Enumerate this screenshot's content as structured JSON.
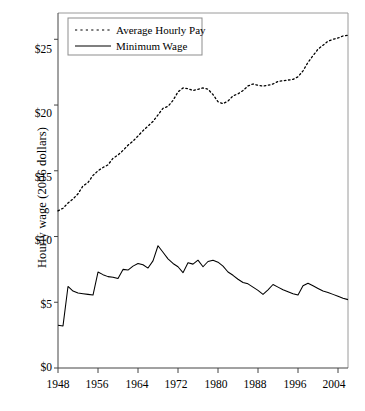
{
  "chart_data": {
    "type": "line",
    "title": "",
    "subtitle": "",
    "xlabel": "",
    "ylabel": "Hourly wage (2006 dollars)",
    "xlim": [
      1948,
      2006
    ],
    "ylim": [
      0,
      27
    ],
    "grid": false,
    "legend_position": "top-left",
    "x_ticks": [
      "1948",
      "1956",
      "1964",
      "1972",
      "1980",
      "1988",
      "1996",
      "2004"
    ],
    "x_tick_values": [
      1948,
      1956,
      1964,
      1972,
      1980,
      1988,
      1996,
      2004
    ],
    "y_ticks": [
      "$0",
      "$5",
      "$10",
      "$15",
      "$20",
      "$25"
    ],
    "y_tick_values": [
      0,
      5,
      10,
      15,
      20,
      25
    ],
    "x": [
      1948,
      1949,
      1950,
      1951,
      1952,
      1953,
      1954,
      1955,
      1956,
      1957,
      1958,
      1959,
      1960,
      1961,
      1962,
      1963,
      1964,
      1965,
      1966,
      1967,
      1968,
      1969,
      1970,
      1971,
      1972,
      1973,
      1974,
      1975,
      1976,
      1977,
      1978,
      1979,
      1980,
      1981,
      1982,
      1983,
      1984,
      1985,
      1986,
      1987,
      1988,
      1989,
      1990,
      1991,
      1992,
      1993,
      1994,
      1995,
      1996,
      1997,
      1998,
      1999,
      2000,
      2001,
      2002,
      2003,
      2004,
      2005,
      2006
    ],
    "series": [
      {
        "name": "Average Hourly Pay",
        "style": "dotted",
        "color": "#000000",
        "values": [
          11.95,
          12.15,
          12.55,
          12.85,
          13.25,
          13.85,
          14.1,
          14.65,
          15.0,
          15.25,
          15.45,
          15.95,
          16.2,
          16.55,
          16.95,
          17.25,
          17.65,
          18.05,
          18.4,
          18.75,
          19.25,
          19.75,
          19.9,
          20.35,
          21.0,
          21.3,
          21.25,
          21.1,
          21.2,
          21.3,
          21.2,
          20.8,
          20.25,
          20.1,
          20.3,
          20.7,
          20.85,
          21.1,
          21.45,
          21.6,
          21.5,
          21.45,
          21.5,
          21.6,
          21.8,
          21.85,
          21.9,
          21.95,
          22.15,
          22.6,
          23.25,
          23.75,
          24.25,
          24.55,
          24.85,
          25.0,
          25.1,
          25.25,
          25.3
        ]
      },
      {
        "name": "Minimum Wage",
        "style": "solid",
        "color": "#000000",
        "values": [
          3.25,
          3.2,
          6.2,
          5.85,
          5.7,
          5.65,
          5.6,
          5.55,
          7.3,
          7.1,
          6.95,
          6.9,
          6.8,
          7.5,
          7.45,
          7.75,
          7.95,
          7.85,
          7.6,
          8.15,
          9.3,
          8.8,
          8.3,
          7.95,
          7.7,
          7.25,
          8.0,
          7.9,
          8.2,
          7.7,
          8.1,
          8.2,
          8.05,
          7.75,
          7.3,
          7.05,
          6.75,
          6.5,
          6.4,
          6.15,
          5.9,
          5.6,
          5.95,
          6.35,
          6.15,
          5.95,
          5.8,
          5.65,
          5.55,
          6.25,
          6.45,
          6.25,
          6.05,
          5.85,
          5.75,
          5.6,
          5.45,
          5.3,
          5.2
        ]
      }
    ]
  },
  "legend": {
    "entries": [
      {
        "label": "Average Hourly Pay",
        "style": "dotted"
      },
      {
        "label": "Minimum Wage",
        "style": "solid"
      }
    ]
  },
  "axes": {
    "y_title": "Hourly wage (2006 dollars)"
  }
}
